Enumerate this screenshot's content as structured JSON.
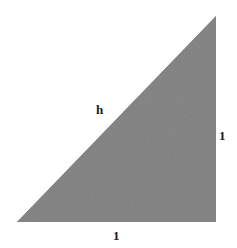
{
  "figure": {
    "kind": "right-triangle-diagram",
    "background_color": "#ffffff",
    "fill_color": "#808080",
    "label_color": "#1a1a1a",
    "vertices": {
      "bottom_left": [
        17,
        222
      ],
      "bottom_right": [
        216,
        222
      ],
      "top_right": [
        216,
        16
      ]
    },
    "labels": {
      "hypotenuse": "h",
      "vertical_leg": "1",
      "horizontal_leg": "1"
    }
  }
}
